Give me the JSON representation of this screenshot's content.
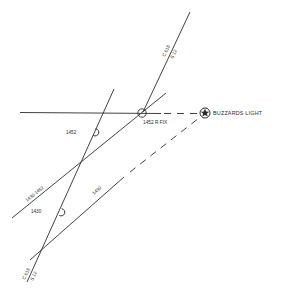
{
  "diagram": {
    "type": "navigation-plot",
    "landmark": {
      "label": "BUZZARDS LIGHT",
      "icon": "lighthouse-star-icon"
    },
    "fix": {
      "label": "1452 R FIX"
    },
    "course_labels": {
      "upper_course": "C 018",
      "upper_speed": "S 12",
      "lower_course": "C 018",
      "lower_speed": "S 12"
    },
    "lop_labels": {
      "running_fix_line": "1430-1452",
      "bearing_1430": "1430",
      "time_1452": "1452",
      "time_1430": "1430"
    }
  }
}
